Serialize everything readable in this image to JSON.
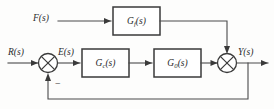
{
  "diagram": {
    "kind": "control-system-block-diagram",
    "background_color": "#fdfdfc",
    "line_color": "#4a4a4a",
    "block_stroke_color": "#3a3a3a",
    "text_color": "#2b2b2b"
  },
  "signals": {
    "feedforward_input": "F(s)",
    "reference_input": "R(s)",
    "error": "E(s)",
    "output": "Y(s)"
  },
  "blocks": {
    "feedforward": {
      "base": "G",
      "sub": "f",
      "arg": "(s)"
    },
    "controller": {
      "base": "G",
      "sub": "c",
      "arg": "(s)"
    },
    "plant": {
      "base": "G",
      "sub": "0",
      "arg": "(s)"
    }
  },
  "summing_junctions": {
    "left": {
      "name": "left-summing-junction",
      "negative_sign": "−"
    },
    "right": {
      "name": "right-summing-junction"
    }
  }
}
